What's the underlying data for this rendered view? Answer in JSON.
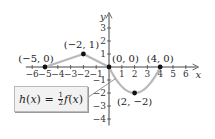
{
  "chart_data": {
    "type": "line",
    "title": "",
    "xlabel": "x",
    "ylabel": "y",
    "xlim": [
      -6.5,
      7
    ],
    "ylim": [
      -4.5,
      4.2
    ],
    "x_ticks": [
      -6,
      -5,
      -4,
      -3,
      -2,
      -1,
      1,
      2,
      3,
      4,
      5,
      6
    ],
    "x_tick_labels": [
      "−6",
      "−5",
      "−4",
      "−3",
      "−2",
      "−1",
      "1",
      "2",
      "3",
      "4",
      "5",
      "6"
    ],
    "y_ticks": [
      -4,
      -3,
      -2,
      -1,
      1,
      2,
      3
    ],
    "y_tick_labels": [
      "−4",
      "−3",
      "−2",
      "−1",
      "1",
      "2",
      "3"
    ],
    "grid": false,
    "series": [
      {
        "name": "h(x) = ½f(x)",
        "color": "#b8b8b8",
        "segments": [
          {
            "kind": "line",
            "points": [
              [
                -5,
                0
              ],
              [
                -2,
                1
              ]
            ]
          },
          {
            "kind": "line",
            "points": [
              [
                -2,
                1
              ],
              [
                0,
                0
              ]
            ]
          },
          {
            "kind": "parabola",
            "points": [
              [
                0,
                0
              ],
              [
                2,
                -2
              ],
              [
                4,
                0
              ]
            ]
          }
        ]
      }
    ],
    "key_points": [
      {
        "x": -5,
        "y": 0,
        "label": "(−5, 0)"
      },
      {
        "x": -2,
        "y": 1,
        "label": "(−2, 1)"
      },
      {
        "x": 0,
        "y": 0,
        "label": "(0, 0)"
      },
      {
        "x": 4,
        "y": 0,
        "label": "(4, 0)"
      },
      {
        "x": 2,
        "y": -2,
        "label": "(2, −2)"
      }
    ],
    "annotation": {
      "func": "h",
      "var": "x",
      "coef_num": "1",
      "coef_den": "2",
      "inner": "f"
    }
  }
}
